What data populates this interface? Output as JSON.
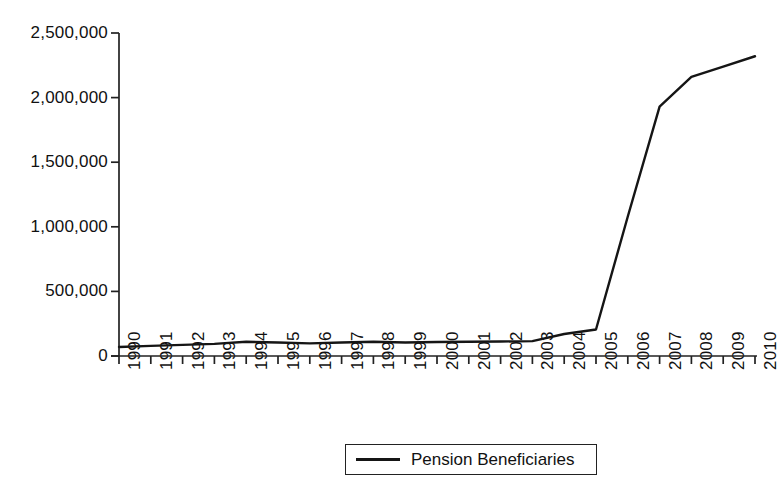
{
  "chart_data": {
    "type": "line",
    "title": "",
    "xlabel": "",
    "ylabel": "",
    "categories": [
      "1990",
      "1991",
      "1992",
      "1993",
      "1994",
      "1995",
      "1996",
      "1997",
      "1998",
      "1999",
      "2000",
      "2001",
      "2002",
      "2003",
      "2004",
      "2005",
      "2006",
      "2007",
      "2008",
      "2009",
      "2010"
    ],
    "series": [
      {
        "name": "Pension Beneficiaries",
        "values": [
          70000,
          78000,
          86000,
          94000,
          110000,
          105000,
          98000,
          105000,
          110000,
          105000,
          108000,
          110000,
          112000,
          115000,
          170000,
          205000,
          1080000,
          1930000,
          2160000,
          2240000,
          2320000
        ]
      }
    ],
    "legend": [
      "Pension Beneficiaries"
    ],
    "legend_position": "bottom",
    "grid": false,
    "ylim": [
      0,
      2500000
    ],
    "yticks": [
      0,
      500000,
      1000000,
      1500000,
      2000000,
      2500000
    ],
    "ytick_labels": [
      "0",
      "500,000",
      "1,000,000",
      "1,500,000",
      "2,000,000",
      "2,500,000"
    ],
    "line_color": "#151515",
    "line_width": 2.4,
    "axis_color": "#222222",
    "background": "#ffffff"
  },
  "legend": {
    "label": "Pension Beneficiaries"
  }
}
